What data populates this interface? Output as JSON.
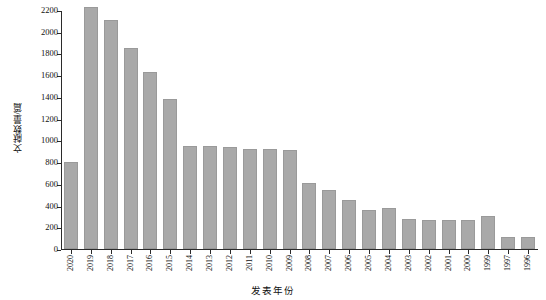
{
  "chart_data": {
    "type": "bar",
    "title": "",
    "xlabel": "发表年份",
    "ylabel": "文献数量/篇",
    "categories": [
      "2020",
      "2019",
      "2018",
      "2017",
      "2016",
      "2015",
      "2014",
      "2013",
      "2012",
      "2011",
      "2010",
      "2009",
      "2008",
      "2007",
      "2006",
      "2005",
      "2004",
      "2003",
      "2002",
      "2001",
      "2000",
      "1999",
      "1997",
      "1996"
    ],
    "values": [
      800,
      2230,
      2110,
      1850,
      1630,
      1380,
      950,
      945,
      935,
      925,
      920,
      915,
      610,
      545,
      455,
      355,
      375,
      280,
      270,
      270,
      270,
      305,
      110,
      110
    ],
    "ylim": [
      0,
      2200
    ],
    "yticks": [
      0,
      200,
      400,
      600,
      800,
      1000,
      1200,
      1400,
      1600,
      1800,
      2000,
      2200
    ],
    "ytick_labels": [
      "0",
      "200",
      "400",
      "600",
      "800",
      "1000",
      "1200",
      "1400",
      "1600",
      "1800",
      "2000",
      "2200"
    ],
    "grid": false,
    "legend": "none",
    "bar_color": "#a9a9a9",
    "axis_color": "#2b2b2b"
  }
}
